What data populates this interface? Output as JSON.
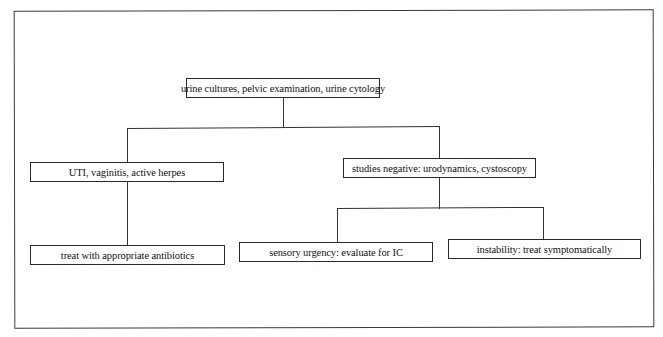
{
  "diagram": {
    "type": "flowchart",
    "nodes": [
      {
        "id": "root",
        "label": "urine cultures, pelvic examination, urine cytology"
      },
      {
        "id": "uti",
        "label": "UTI, vaginitis, active herpes"
      },
      {
        "id": "studies",
        "label": "studies negative: urodynamics, cystoscopy"
      },
      {
        "id": "treat",
        "label": "treat with appropriate antibiotics"
      },
      {
        "id": "sensory",
        "label": "sensory urgency: evaluate for IC"
      },
      {
        "id": "instability",
        "label": "instability: treat symptomatically"
      }
    ],
    "edges": [
      {
        "from": "root",
        "to": "uti"
      },
      {
        "from": "root",
        "to": "studies"
      },
      {
        "from": "uti",
        "to": "treat"
      },
      {
        "from": "studies",
        "to": "sensory"
      },
      {
        "from": "studies",
        "to": "instability"
      }
    ]
  }
}
